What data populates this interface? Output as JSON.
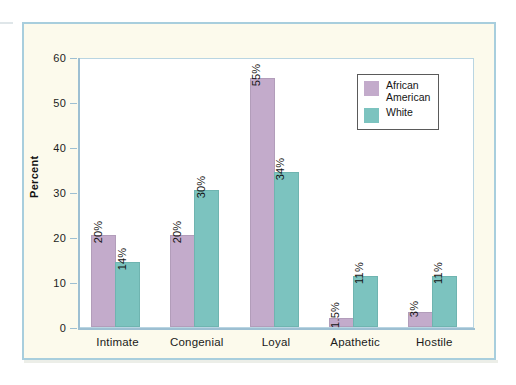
{
  "figure": {
    "panel_background": "#fcfaec",
    "panel_border": "#a8cedd",
    "plot_background": "#ffffff"
  },
  "chart_data": {
    "type": "bar",
    "title": "",
    "subtitle": "",
    "xlabel": "",
    "ylabel": "Percent",
    "ylim": [
      0,
      60
    ],
    "yticks": [
      0,
      10,
      20,
      30,
      40,
      50,
      60
    ],
    "ytick_labels": [
      "0",
      "10",
      "20",
      "30",
      "40",
      "50",
      "60"
    ],
    "grid": false,
    "legend_position": "top-right",
    "categories": [
      "Intimate",
      "Congenial",
      "Loyal",
      "Apathetic",
      "Hostile"
    ],
    "series": [
      {
        "name": "African American",
        "color": "#c3abcb",
        "values": [
          20,
          20,
          55,
          1.5,
          3
        ],
        "labels": [
          "20%",
          "20%",
          "55%",
          "1.5%",
          "3%"
        ]
      },
      {
        "name": "White",
        "color": "#7cc3bf",
        "values": [
          14,
          30,
          34,
          11,
          11
        ],
        "labels": [
          "14%",
          "30%",
          "34%",
          "11%",
          "11%"
        ]
      }
    ]
  },
  "legend": {
    "entries": [
      {
        "label": "African\nAmerican",
        "color": "#c3abcb"
      },
      {
        "label": "White",
        "color": "#7cc3bf"
      }
    ]
  }
}
